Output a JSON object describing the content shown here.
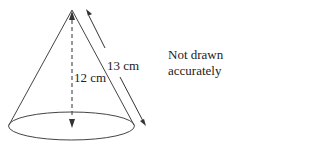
{
  "diagram": {
    "type": "cone",
    "labels": {
      "height": "12 cm",
      "slant_height": "13 cm"
    },
    "note": {
      "line1": "Not drawn",
      "line2": "accurately"
    },
    "colors": {
      "stroke": "#333333",
      "background": "#ffffff"
    }
  }
}
